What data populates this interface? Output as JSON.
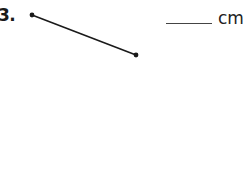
{
  "problem": {
    "number": "3.",
    "answer_value": "",
    "unit": "cm",
    "segment": {
      "start": [
        32,
        15
      ],
      "end": [
        136,
        55
      ],
      "color": "#1a1a1a"
    }
  }
}
